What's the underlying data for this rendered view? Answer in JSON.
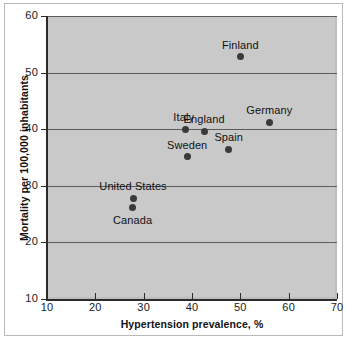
{
  "chart_data": {
    "type": "scatter",
    "title": "",
    "xlabel": "Hypertension prevalence, %",
    "ylabel": "Mortality per 100,000 inhabitants",
    "xlim": [
      10,
      70
    ],
    "ylim": [
      10,
      60
    ],
    "xticks": [
      10,
      20,
      30,
      40,
      50,
      60,
      70
    ],
    "yticks": [
      10,
      20,
      30,
      40,
      50,
      60
    ],
    "xticklabels": [
      "10",
      "20",
      "30",
      "40",
      "50",
      "60",
      "70"
    ],
    "yticklabels": [
      "10",
      "20",
      "30",
      "40",
      "50",
      "60"
    ],
    "grid": "horizontal",
    "gridlines_y": [
      20,
      30,
      40,
      50,
      60
    ],
    "legend": "none",
    "plot_background": "#c9c9c9",
    "marker_color": "#3a3a3a",
    "gridline_color": "#5b5b5b",
    "points": [
      {
        "label": "Finland",
        "x": 50.0,
        "y": 52.8,
        "label_pos": "above"
      },
      {
        "label": "Germany",
        "x": 56.0,
        "y": 41.2,
        "label_pos": "above"
      },
      {
        "label": "Italy",
        "x": 38.7,
        "y": 40.0,
        "label_pos": "above-left"
      },
      {
        "label": "England",
        "x": 42.5,
        "y": 39.6,
        "label_pos": "above"
      },
      {
        "label": "Spain",
        "x": 47.6,
        "y": 36.5,
        "label_pos": "above"
      },
      {
        "label": "Sweden",
        "x": 39.0,
        "y": 35.1,
        "label_pos": "above"
      },
      {
        "label": "United States",
        "x": 27.8,
        "y": 27.8,
        "label_pos": "above"
      },
      {
        "label": "Canada",
        "x": 27.7,
        "y": 26.1,
        "label_pos": "below"
      }
    ]
  }
}
